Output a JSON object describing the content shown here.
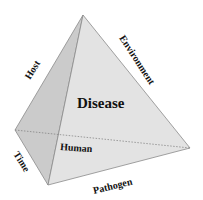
{
  "diagram": {
    "title": "Disease",
    "labels": {
      "host": "Host",
      "environment": "Environment",
      "time": "Time",
      "pathogen": "Pathogen",
      "human": "Human"
    },
    "colors": {
      "left_face": "#c9c9c9",
      "front_face": "#e2e2e2",
      "edge": "#8a8a8a"
    }
  }
}
